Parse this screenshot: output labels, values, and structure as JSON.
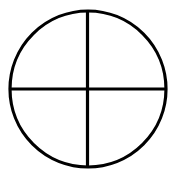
{
  "diagram": {
    "type": "circle-with-cross",
    "stroke_color": "#000000",
    "background_color": "#ffffff",
    "stroke_width": 3.2,
    "circle": {
      "cx": 88,
      "cy": 89,
      "r": 78
    },
    "horizontal_line": {
      "x1": 10,
      "y1": 89,
      "x2": 166,
      "y2": 89
    },
    "vertical_line": {
      "x1": 87.5,
      "y1": 11,
      "x2": 87.5,
      "y2": 167
    }
  }
}
